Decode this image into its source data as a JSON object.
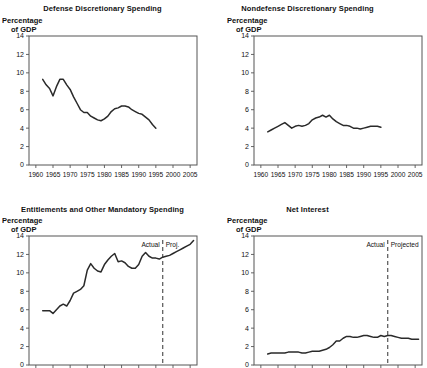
{
  "figure": {
    "y_axis_label_line1": "Percentage",
    "y_axis_label_line2": "of GDP",
    "y_ticks": [
      0,
      2,
      4,
      6,
      8,
      10,
      12,
      14
    ],
    "x_ticks": [
      1960,
      1965,
      1970,
      1975,
      1980,
      1985,
      1990,
      1995,
      2000,
      2005
    ],
    "x_range": [
      1958,
      2007
    ],
    "y_range": [
      0,
      14
    ]
  },
  "panels": [
    {
      "title": "Defense Discretionary Spending",
      "show_x_labels": true,
      "show_divider": false,
      "actual_label": "",
      "projected_label": ""
    },
    {
      "title": "Nondefense Discretionary Spending",
      "show_x_labels": true,
      "show_divider": false,
      "actual_label": "",
      "projected_label": ""
    },
    {
      "title": "Entitlements and Other Mandatory Spending",
      "show_x_labels": false,
      "show_divider": true,
      "divider_year": 1997,
      "actual_label": "Actual",
      "projected_label": "Proj."
    },
    {
      "title": "Net Interest",
      "show_x_labels": false,
      "show_divider": true,
      "divider_year": 1997,
      "actual_label": "Actual",
      "projected_label": "Projected"
    }
  ],
  "chart_data": [
    {
      "type": "line",
      "title": "Defense Discretionary Spending",
      "xlabel": "",
      "ylabel": "Percentage of GDP",
      "xlim": [
        1958,
        2007
      ],
      "ylim": [
        0,
        14
      ],
      "grid": false,
      "legend": "none",
      "x": [
        1962,
        1963,
        1964,
        1965,
        1966,
        1967,
        1968,
        1969,
        1970,
        1971,
        1972,
        1973,
        1974,
        1975,
        1976,
        1977,
        1978,
        1979,
        1980,
        1981,
        1982,
        1983,
        1984,
        1985,
        1986,
        1987,
        1988,
        1989,
        1990,
        1991,
        1992,
        1993,
        1994,
        1995
      ],
      "values": [
        9.3,
        8.7,
        8.3,
        7.5,
        8.5,
        9.3,
        9.3,
        8.7,
        8.2,
        7.4,
        6.7,
        6.0,
        5.7,
        5.7,
        5.3,
        5.1,
        4.9,
        4.8,
        5.0,
        5.3,
        5.8,
        6.1,
        6.2,
        6.4,
        6.4,
        6.3,
        6.0,
        5.8,
        5.6,
        5.5,
        5.2,
        4.9,
        4.4,
        4.0
      ],
      "series_name": "Defense discretionary spending"
    },
    {
      "type": "line",
      "title": "Nondefense Discretionary Spending",
      "xlabel": "",
      "ylabel": "Percentage of GDP",
      "xlim": [
        1958,
        2007
      ],
      "ylim": [
        0,
        14
      ],
      "grid": false,
      "legend": "none",
      "x": [
        1962,
        1963,
        1964,
        1965,
        1966,
        1967,
        1968,
        1969,
        1970,
        1971,
        1972,
        1973,
        1974,
        1975,
        1976,
        1977,
        1978,
        1979,
        1980,
        1981,
        1982,
        1983,
        1984,
        1985,
        1986,
        1987,
        1988,
        1989,
        1990,
        1991,
        1992,
        1993,
        1994,
        1995
      ],
      "values": [
        3.6,
        3.8,
        4.0,
        4.2,
        4.4,
        4.6,
        4.3,
        4.0,
        4.2,
        4.3,
        4.2,
        4.3,
        4.5,
        4.9,
        5.1,
        5.2,
        5.4,
        5.2,
        5.4,
        5.0,
        4.7,
        4.5,
        4.3,
        4.3,
        4.2,
        4.0,
        4.0,
        3.9,
        4.0,
        4.1,
        4.2,
        4.2,
        4.2,
        4.1
      ],
      "series_name": "Nondefense discretionary spending"
    },
    {
      "type": "line",
      "title": "Entitlements and Other Mandatory Spending",
      "xlabel": "",
      "ylabel": "Percentage of GDP",
      "xlim": [
        1958,
        2007
      ],
      "ylim": [
        0,
        14
      ],
      "grid": false,
      "legend": "none",
      "divider_year": 1997,
      "divider_labels": [
        "Actual",
        "Proj."
      ],
      "x": [
        1962,
        1963,
        1964,
        1965,
        1966,
        1967,
        1968,
        1969,
        1970,
        1971,
        1972,
        1973,
        1974,
        1975,
        1976,
        1977,
        1978,
        1979,
        1980,
        1981,
        1982,
        1983,
        1984,
        1985,
        1986,
        1987,
        1988,
        1989,
        1990,
        1991,
        1992,
        1993,
        1994,
        1995,
        1996,
        1997,
        1998,
        1999,
        2000,
        2001,
        2002,
        2003,
        2004,
        2005,
        2006
      ],
      "values": [
        5.9,
        5.9,
        5.9,
        5.6,
        6.0,
        6.4,
        6.6,
        6.4,
        7.0,
        7.8,
        8.0,
        8.2,
        8.6,
        10.3,
        11.0,
        10.5,
        10.2,
        10.1,
        10.9,
        11.4,
        11.8,
        12.1,
        11.2,
        11.3,
        11.1,
        10.7,
        10.5,
        10.5,
        10.9,
        11.8,
        12.2,
        11.8,
        11.6,
        11.6,
        11.5,
        11.7,
        11.8,
        11.9,
        12.1,
        12.3,
        12.5,
        12.7,
        12.9,
        13.1,
        13.5
      ],
      "series_name": "Entitlements and other mandatory spending"
    },
    {
      "type": "line",
      "title": "Net Interest",
      "xlabel": "",
      "ylabel": "Percentage of GDP",
      "xlim": [
        1958,
        2007
      ],
      "ylim": [
        0,
        14
      ],
      "grid": false,
      "legend": "none",
      "divider_year": 1997,
      "divider_labels": [
        "Actual",
        "Projected"
      ],
      "x": [
        1962,
        1963,
        1964,
        1965,
        1966,
        1967,
        1968,
        1969,
        1970,
        1971,
        1972,
        1973,
        1974,
        1975,
        1976,
        1977,
        1978,
        1979,
        1980,
        1981,
        1982,
        1983,
        1984,
        1985,
        1986,
        1987,
        1988,
        1989,
        1990,
        1991,
        1992,
        1993,
        1994,
        1995,
        1996,
        1997,
        1998,
        1999,
        2000,
        2001,
        2002,
        2003,
        2004,
        2005,
        2006
      ],
      "values": [
        1.2,
        1.3,
        1.3,
        1.3,
        1.3,
        1.3,
        1.4,
        1.4,
        1.4,
        1.4,
        1.3,
        1.3,
        1.4,
        1.5,
        1.5,
        1.5,
        1.6,
        1.7,
        1.9,
        2.2,
        2.6,
        2.6,
        2.9,
        3.1,
        3.1,
        3.0,
        3.0,
        3.1,
        3.2,
        3.2,
        3.1,
        3.0,
        3.0,
        3.2,
        3.1,
        3.2,
        3.2,
        3.1,
        3.0,
        2.9,
        2.9,
        2.9,
        2.8,
        2.8,
        2.8
      ],
      "series_name": "Net interest"
    }
  ]
}
